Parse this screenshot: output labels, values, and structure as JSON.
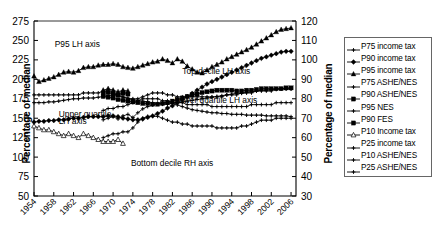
{
  "chart_data": {
    "type": "line",
    "title": "",
    "xlabel": "",
    "ylabel": "Percentage of median",
    "ylabel_right": "Percentage of median",
    "xlim": [
      1954,
      2007
    ],
    "ylim": [
      50,
      275
    ],
    "ylim_right": [
      30,
      120
    ],
    "xticks": [
      1954,
      1958,
      1962,
      1966,
      1970,
      1974,
      1978,
      1982,
      1986,
      1990,
      1994,
      1998,
      2002,
      2006
    ],
    "yticks_left": [
      50,
      75,
      100,
      125,
      150,
      175,
      200,
      225,
      250,
      275
    ],
    "yticks_right": [
      30,
      40,
      50,
      60,
      70,
      80,
      90,
      100,
      110,
      120
    ],
    "grid": false,
    "legend_position": "right-outside",
    "annotations": [
      {
        "text": "P95 LH axis",
        "x": 1958.2,
        "y": 241
      },
      {
        "text": "Top decile LH axis",
        "x": 1984.0,
        "y": 207
      },
      {
        "text": "Lower quartile LH axis",
        "x": 1982.4,
        "y": 170
      },
      {
        "text": "Upper quartile",
        "x": 1959.0,
        "y": 152
      },
      {
        "text": "LH axis",
        "x": 1959.0,
        "y": 143
      },
      {
        "text": "Bottom decile RH axis",
        "x": 1973.6,
        "y": 88
      }
    ],
    "series": [
      {
        "name": "P75 income tax",
        "axis": "left",
        "marker": "plus-small",
        "x": [
          1954,
          1955,
          1956,
          1957,
          1958,
          1959,
          1960,
          1961,
          1962,
          1963,
          1964,
          1965,
          1966,
          1967,
          1968,
          1969,
          1970,
          1971,
          1972,
          1973,
          1974,
          1975,
          1976,
          1977,
          1978,
          1979,
          1980,
          1981,
          1982,
          1983,
          1984,
          1985,
          1986,
          1987,
          1988,
          1989,
          1990,
          1991,
          1992,
          1993,
          1994,
          1995,
          1996,
          1997,
          1998,
          1999,
          2000,
          2001,
          2002,
          2003,
          2004,
          2005,
          2006
        ],
        "values": [
          170,
          170,
          170,
          171,
          171,
          172,
          173,
          174,
          175,
          175,
          176,
          176,
          176,
          177,
          178,
          179,
          180,
          179,
          177,
          176,
          174,
          173,
          172,
          171,
          170,
          169,
          168,
          168,
          169,
          170,
          171,
          172,
          173,
          174,
          175,
          176,
          177,
          178,
          179,
          180,
          181,
          182,
          182,
          183,
          184,
          185,
          186,
          186,
          187,
          187,
          188,
          188,
          188
        ]
      },
      {
        "name": "P90 income tax",
        "axis": "left",
        "marker": "diamond-filled",
        "x": [
          1954,
          1955,
          1956,
          1957,
          1958,
          1959,
          1960,
          1961,
          1962,
          1963,
          1964,
          1965,
          1966,
          1967,
          1968,
          1969,
          1970,
          1971,
          1972,
          1973,
          1974,
          1975,
          1976,
          1977,
          1978,
          1979,
          1980,
          1981,
          1982,
          1983,
          1984,
          1985,
          1986,
          1987,
          1988,
          1989,
          1990,
          1991,
          1992,
          1993,
          1994,
          1995,
          1996,
          1997,
          1998,
          1999,
          2000,
          2001,
          2002,
          2003,
          2004,
          2005,
          2006
        ],
        "values": [
          145,
          146,
          146,
          147,
          147,
          148,
          148,
          149,
          150,
          150,
          151,
          152,
          152,
          152,
          152,
          153,
          153,
          152,
          150,
          149,
          148,
          148,
          149,
          151,
          153,
          156,
          159,
          163,
          166,
          170,
          174,
          178,
          182,
          186,
          190,
          194,
          197,
          200,
          203,
          206,
          209,
          212,
          215,
          218,
          221,
          224,
          227,
          229,
          231,
          233,
          235,
          236,
          236
        ]
      },
      {
        "name": "P95 income tax",
        "axis": "left",
        "marker": "triangle-filled",
        "x": [
          1954,
          1955,
          1956,
          1957,
          1958,
          1959,
          1960,
          1961,
          1962,
          1963,
          1964,
          1965,
          1966,
          1967,
          1968,
          1969,
          1970,
          1971,
          1972,
          1973,
          1974,
          1975,
          1976,
          1977,
          1978,
          1979,
          1980,
          1981,
          1982,
          1983,
          1984,
          1985,
          1986,
          1987,
          1988,
          1989,
          1990,
          1991,
          1992,
          1993,
          1994,
          1995,
          1996,
          1997,
          1998,
          1999,
          2000,
          2001,
          2002,
          2003,
          2004,
          2005,
          2006
        ],
        "values": [
          204,
          197,
          199,
          201,
          203,
          206,
          209,
          210,
          209,
          211,
          215,
          216,
          216,
          218,
          219,
          219,
          220,
          219,
          216,
          215,
          214,
          216,
          218,
          220,
          222,
          223,
          226,
          224,
          221,
          226,
          223,
          217,
          213,
          209,
          208,
          212,
          216,
          219,
          222,
          226,
          229,
          232,
          235,
          238,
          241,
          245,
          249,
          253,
          257,
          261,
          264,
          265,
          266
        ]
      },
      {
        "name": "P75 ASHE/NES",
        "axis": "left",
        "marker": "plus-small",
        "x": [
          1968,
          1969,
          1970,
          1971,
          1972,
          1973,
          1974,
          1975,
          1976,
          1977,
          1978,
          1979,
          1980,
          1981,
          1982,
          1983,
          1984,
          1985,
          1986,
          1987,
          1988,
          1989,
          1990,
          1991,
          1992,
          1993,
          1994,
          1995,
          1996,
          1997,
          1998,
          1999,
          2000,
          2001,
          2002,
          2003,
          2004,
          2005,
          2006
        ],
        "values": [
          148,
          150,
          152,
          149,
          153,
          155,
          151,
          157,
          162,
          165,
          167,
          169,
          170,
          170,
          169,
          167,
          165,
          163,
          161,
          160,
          159,
          158,
          157,
          157,
          156,
          156,
          155,
          155,
          155,
          154,
          154,
          154,
          154,
          153,
          153,
          153,
          153,
          153,
          152
        ]
      },
      {
        "name": "P90 ASHE/NES",
        "axis": "left",
        "marker": "square-filled",
        "x": [
          1968,
          1969,
          1970,
          1971,
          1972,
          1973,
          1974,
          1975,
          1976,
          1977,
          1978,
          1979,
          1980,
          1981,
          1982,
          1983,
          1984,
          1985,
          1986,
          1987,
          1988,
          1989,
          1990,
          1991,
          1992,
          1993,
          1994,
          1995,
          1996,
          1997,
          1998,
          1999,
          2000,
          2001,
          2002,
          2003,
          2004,
          2005,
          2006
        ],
        "values": [
          178,
          177,
          176,
          174,
          173,
          172,
          171,
          170,
          169,
          169,
          168,
          168,
          169,
          170,
          172,
          174,
          176,
          178,
          180,
          181,
          183,
          184,
          185,
          186,
          186,
          186,
          186,
          185,
          185,
          186,
          186,
          187,
          188,
          188,
          188,
          188,
          188,
          189,
          189
        ]
      },
      {
        "name": "P95 NES",
        "axis": "left",
        "marker": "triangle-filled",
        "x": [
          1968,
          1969,
          1970,
          1971,
          1972,
          1973
        ],
        "values": [
          186,
          188,
          186,
          184,
          186,
          185
        ]
      },
      {
        "name": "P90 FES",
        "axis": "left",
        "marker": "square-filled",
        "x": [
          1968,
          1969,
          1970,
          1971,
          1972,
          1973
        ],
        "values": [
          182,
          183,
          181,
          180,
          182,
          181
        ]
      },
      {
        "name": "P10 Income tax",
        "axis": "right",
        "marker": "triangle-open",
        "x": [
          1954,
          1955,
          1956,
          1957,
          1958,
          1959,
          1960,
          1961,
          1962,
          1963,
          1964,
          1965,
          1966,
          1967,
          1968,
          1969,
          1970,
          1971,
          1972
        ],
        "values": [
          66,
          65,
          64,
          64,
          63,
          62,
          61,
          62,
          61,
          60,
          62,
          61,
          60,
          59,
          58,
          58,
          58,
          59,
          57
        ]
      },
      {
        "name": "P25 income tax",
        "axis": "right",
        "marker": "plus-small",
        "x": [
          1954,
          1955,
          1956,
          1957,
          1958,
          1959,
          1960,
          1961,
          1962,
          1963,
          1964,
          1965,
          1966,
          1967,
          1968,
          1969,
          1970,
          1971,
          1972,
          1973,
          1974,
          1975,
          1976,
          1977,
          1978,
          1979,
          1980,
          1981,
          1982,
          1983,
          1984,
          1985,
          1986,
          1987,
          1988,
          1989,
          1990,
          1991,
          1992,
          1993,
          1994,
          1995,
          1996,
          1997,
          1998,
          1999,
          2000,
          2001,
          2002,
          2003,
          2004,
          2005,
          2006
        ],
        "values": [
          82,
          82,
          82,
          82,
          82,
          82,
          82,
          82,
          82,
          82,
          83,
          83,
          83,
          83,
          84,
          84,
          83,
          82,
          81,
          80,
          80,
          80,
          81,
          82,
          83,
          83,
          83,
          82,
          82,
          81,
          81,
          81,
          81,
          81,
          81,
          81,
          81,
          81,
          81,
          82,
          82,
          82,
          83,
          83,
          83,
          84,
          84,
          84,
          84,
          85,
          85,
          85,
          85
        ]
      },
      {
        "name": "P10 ASHE/NES",
        "axis": "right",
        "marker": "plus-small",
        "x": [
          1968,
          1969,
          1970,
          1971,
          1972,
          1973,
          1974,
          1975,
          1976,
          1977,
          1978,
          1979,
          1980,
          1981,
          1982,
          1983,
          1984,
          1985,
          1986,
          1987,
          1988,
          1989,
          1990,
          1991,
          1992,
          1993,
          1994,
          1995,
          1996,
          1997,
          1998,
          1999,
          2000,
          2001,
          2002,
          2003,
          2004,
          2005,
          2006
        ],
        "values": [
          60,
          61,
          62,
          62,
          63,
          63,
          65,
          68,
          70,
          71,
          71,
          71,
          70,
          69,
          68,
          68,
          67,
          67,
          66,
          66,
          66,
          66,
          66,
          65,
          65,
          65,
          65,
          65,
          66,
          66,
          67,
          68,
          69,
          69,
          69,
          70,
          70,
          70,
          70
        ]
      },
      {
        "name": "P25 ASHE/NES",
        "axis": "right",
        "marker": "plus-small",
        "x": [
          1968,
          1969,
          1970,
          1971,
          1972,
          1973,
          1974,
          1975,
          1976,
          1977,
          1978,
          1979,
          1980,
          1981,
          1982,
          1983,
          1984,
          1985,
          1986,
          1987,
          1988,
          1989,
          1990,
          1991,
          1992,
          1993,
          1994,
          1995,
          1996,
          1997,
          1998,
          1999,
          2000,
          2001,
          2002,
          2003,
          2004,
          2005,
          2006
        ],
        "values": [
          74,
          75,
          75,
          76,
          76,
          77,
          78,
          79,
          80,
          80,
          80,
          80,
          79,
          79,
          78,
          78,
          78,
          77,
          77,
          77,
          77,
          77,
          76,
          76,
          76,
          76,
          76,
          76,
          76,
          76,
          77,
          77,
          77,
          77,
          77,
          78,
          78,
          78,
          78
        ]
      }
    ]
  },
  "legend": {
    "items": [
      {
        "label": "P75 income tax",
        "marker": "plus-small"
      },
      {
        "label": "P90 income tax",
        "marker": "diamond-filled"
      },
      {
        "label": "P95 income tax",
        "marker": "triangle-filled"
      },
      {
        "label": "P75 ASHE/NES",
        "marker": "plus-small"
      },
      {
        "label": "P90 ASHE/NES",
        "marker": "square-filled"
      },
      {
        "label": "P95 NES",
        "marker": "plus-small"
      },
      {
        "label": "P90 FES",
        "marker": "square-filled"
      },
      {
        "label": "P10 Income tax",
        "marker": "triangle-open"
      },
      {
        "label": "P25 income tax",
        "marker": "plus-small"
      },
      {
        "label": "P10 ASHE/NES",
        "marker": "plus-small"
      },
      {
        "label": "P25 ASHE/NES",
        "marker": "plus-small"
      }
    ]
  },
  "colors": {
    "series": "#000000",
    "axis": "#000000",
    "background": "#ffffff",
    "legend_border": "#666666"
  }
}
